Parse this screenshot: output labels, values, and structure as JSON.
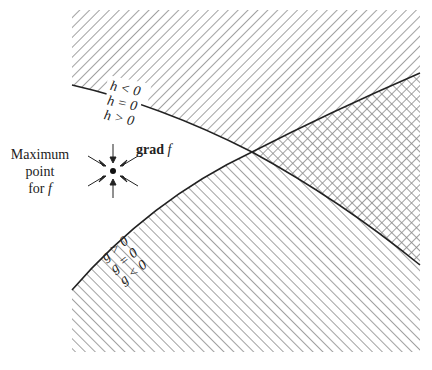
{
  "diagram": {
    "type": "constraint-optimization-illustration",
    "frame": {
      "x": 72,
      "y": 10,
      "width": 348,
      "height": 342
    },
    "colors": {
      "hatch": "#8a8a8a",
      "curve": "#222222",
      "background": "#ffffff",
      "text": "#222222"
    },
    "curves": {
      "h": {
        "name": "h = 0",
        "start": [
          72,
          85
        ],
        "mid": [
          252,
          152
        ],
        "end": [
          420,
          265
        ]
      },
      "g": {
        "name": "g = 0",
        "start": [
          72,
          290
        ],
        "mid": [
          252,
          152
        ],
        "end": [
          420,
          73
        ]
      }
    },
    "intersection": [
      252,
      152
    ],
    "maximum_point": [
      105,
      171
    ]
  },
  "labels": {
    "maximum_line1": "Maximum",
    "maximum_line2": "point",
    "maximum_line3_prefix": "for ",
    "maximum_line3_var": "f",
    "grad_bold": "grad",
    "grad_var": " f",
    "h_less": "h < 0",
    "h_equal": "h = 0",
    "h_greater": "h > 0",
    "g_greater": "g > 0",
    "g_equal": "g = 0",
    "g_less": "g < 0"
  }
}
